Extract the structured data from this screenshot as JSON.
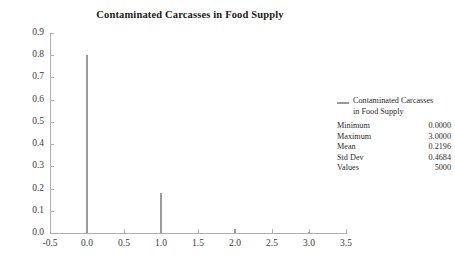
{
  "chart_data": {
    "type": "bar",
    "title": "Contaminated Carcasses in Food Supply",
    "xlabel": "",
    "ylabel": "",
    "x": [
      0.0,
      1.0,
      2.0,
      3.0
    ],
    "values": [
      0.8,
      0.18,
      0.018,
      0.004
    ],
    "categories": [
      "0.0",
      "1.0",
      "2.0",
      "3.0"
    ],
    "xlim": [
      -0.5,
      3.5
    ],
    "ylim": [
      0.0,
      0.9
    ],
    "x_ticks": [
      "-0.5",
      "0.0",
      "0.5",
      "1.0",
      "1.5",
      "2.0",
      "2.5",
      "3.0",
      "3.5"
    ],
    "x_tick_values": [
      -0.5,
      0.0,
      0.5,
      1.0,
      1.5,
      2.0,
      2.5,
      3.0,
      3.5
    ],
    "y_ticks": [
      "0.0",
      "0.1",
      "0.2",
      "0.3",
      "0.4",
      "0.5",
      "0.6",
      "0.7",
      "0.8",
      "0.9"
    ],
    "y_tick_values": [
      0.0,
      0.1,
      0.2,
      0.3,
      0.4,
      0.5,
      0.6,
      0.7,
      0.8,
      0.9
    ],
    "grid": false,
    "legend_position": "right",
    "series_color": "#9a9a9a",
    "axis_color": "#b0b0b0",
    "text_color": "#2b2b2b"
  },
  "legend": {
    "series_label_line1": "Contaminated Carcasses",
    "series_label_line2": "in Food Supply",
    "stats": [
      {
        "name": "Minimum",
        "value": "0.0000"
      },
      {
        "name": "Maximum",
        "value": "3.0000"
      },
      {
        "name": "Mean",
        "value": "0.2196"
      },
      {
        "name": "Std Dev",
        "value": "0.4684"
      },
      {
        "name": "Values",
        "value": "5000"
      }
    ]
  }
}
